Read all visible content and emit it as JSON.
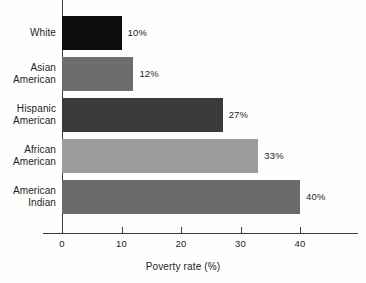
{
  "chart_data": {
    "type": "bar",
    "orientation": "horizontal",
    "title": "",
    "xlabel": "Poverty rate (%)",
    "ylabel": "",
    "xlim": [
      0,
      40
    ],
    "xticks": [
      0,
      10,
      20,
      30,
      40
    ],
    "xtick_labels": [
      "0",
      "10",
      "20",
      "30",
      "40"
    ],
    "grid": false,
    "legend": false,
    "categories": [
      "White",
      "Asian American",
      "Hispanic American",
      "African American",
      "American Indian"
    ],
    "values": [
      10,
      12,
      27,
      33,
      40
    ],
    "value_labels": [
      "10%",
      "12%",
      "27%",
      "33%",
      "40%"
    ],
    "bar_colors": [
      "#0d0d0d",
      "#6d6d6d",
      "#3b3b3b",
      "#9b9b9b",
      "#6a6a6a"
    ],
    "bars": [
      {
        "category_line1": "White",
        "category_line2": "",
        "value": 10,
        "label": "10%",
        "color": "#0d0d0d"
      },
      {
        "category_line1": "Asian",
        "category_line2": "American",
        "value": 12,
        "label": "12%",
        "color": "#6d6d6d"
      },
      {
        "category_line1": "Hispanic",
        "category_line2": "American",
        "value": 27,
        "label": "27%",
        "color": "#3b3b3b"
      },
      {
        "category_line1": "African",
        "category_line2": "American",
        "value": 33,
        "label": "33%",
        "color": "#9b9b9b"
      },
      {
        "category_line1": "American",
        "category_line2": "Indian",
        "value": 40,
        "label": "40%",
        "color": "#6a6a6a"
      }
    ],
    "axis_color": "#3b3b3b",
    "background_color": "#fefefe",
    "text_color": "#231f20"
  }
}
